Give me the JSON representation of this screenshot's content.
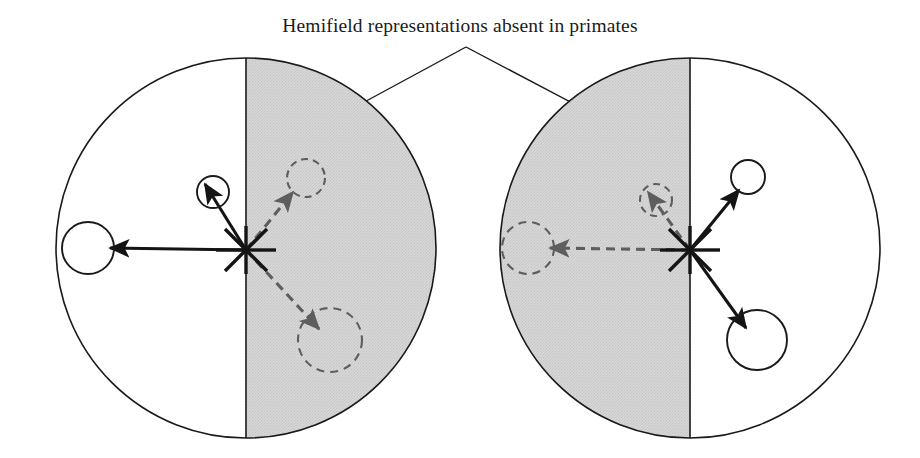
{
  "figure": {
    "caption": "Hemifield representations absent in primates",
    "width": 920,
    "height": 458,
    "background_color": "#ffffff",
    "stroke_color": "#1a1a1a",
    "shaded_color": "#d2d2d2",
    "dashed_color": "#666666"
  },
  "annotation": {
    "leader_apex": "466,47",
    "leader_left_end": "320,126",
    "leader_right_end": "616,126"
  },
  "panels": [
    {
      "id": "left-panel",
      "name": "left-visual-field-diagram",
      "center": "246,248",
      "radius": 190,
      "shaded_half": "right",
      "fixation_point": "246,250",
      "targets": [
        {
          "name": "left-solid-target",
          "style": "solid",
          "circle_center": "88,248",
          "circle_radius": 26,
          "arrow_from": "246,250",
          "arrow_to": "110,248"
        },
        {
          "name": "upper-left-solid-target",
          "style": "solid",
          "circle_center": "213,192",
          "circle_radius": 16,
          "arrow_from": "246,250",
          "arrow_to": "205,184"
        },
        {
          "name": "upper-right-dashed-target",
          "style": "dashed",
          "circle_center": "306,178",
          "circle_radius": 19,
          "arrow_from": "246,250",
          "arrow_to": "293,192"
        },
        {
          "name": "lower-right-dashed-target",
          "style": "dashed",
          "circle_center": "330,340",
          "circle_radius": 32,
          "arrow_from": "246,250",
          "arrow_to": "319,329"
        }
      ]
    },
    {
      "id": "right-panel",
      "name": "right-visual-field-diagram",
      "center": "690,248",
      "radius": 190,
      "shaded_half": "left",
      "fixation_point": "690,250",
      "targets": [
        {
          "name": "left-dashed-target",
          "style": "dashed",
          "circle_center": "528,248",
          "circle_radius": 26,
          "arrow_from": "690,250",
          "arrow_to": "550,248"
        },
        {
          "name": "upper-left-dashed-target",
          "style": "dashed",
          "circle_center": "656,200",
          "circle_radius": 16,
          "arrow_from": "690,250",
          "arrow_to": "648,192"
        },
        {
          "name": "upper-right-solid-target",
          "style": "solid",
          "circle_center": "748,177",
          "circle_radius": 17,
          "arrow_from": "690,250",
          "arrow_to": "739,190"
        },
        {
          "name": "lower-right-solid-target",
          "style": "solid",
          "circle_center": "757,340",
          "circle_radius": 30,
          "arrow_from": "690,250",
          "arrow_to": "746,328"
        }
      ]
    }
  ]
}
